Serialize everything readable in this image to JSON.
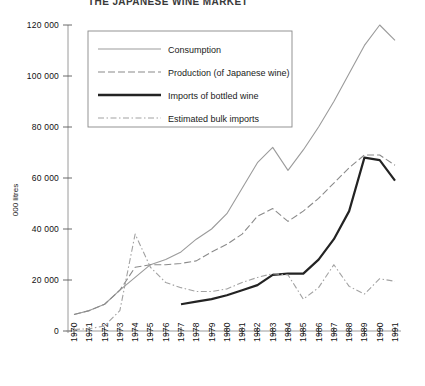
{
  "title_partial": "THE JAPANESE WINE MARKET",
  "axis": {
    "ylabel": "000 litres",
    "yticks": [
      "0",
      "20 000",
      "40 000",
      "60 000",
      "80 000",
      "100 000",
      "120 000"
    ],
    "xticks": [
      "1970",
      "1971",
      "1972",
      "1973",
      "1974",
      "1975",
      "1976",
      "1977",
      "1978",
      "1979",
      "1980",
      "1981",
      "1982",
      "1983",
      "1984",
      "1985",
      "1986",
      "1987",
      "1988",
      "1989",
      "1990",
      "1991"
    ]
  },
  "legend": {
    "items": [
      {
        "label": "Consumption",
        "style": "solid-thin",
        "color": "#9b9b9b"
      },
      {
        "label": "Production (of Japanese wine)",
        "style": "dashed",
        "color": "#8a8a8a"
      },
      {
        "label": "Imports of bottled wine",
        "style": "solid-thick",
        "color": "#232323"
      },
      {
        "label": "Estimated bulk imports",
        "style": "dash-dot",
        "color": "#a2a2a2"
      }
    ]
  },
  "chart_data": {
    "type": "line",
    "title": "THE JAPANESE WINE MARKET",
    "xlabel": "",
    "ylabel": "000 litres",
    "ylim": [
      0,
      120000
    ],
    "ytick_step": 20000,
    "grid": false,
    "legend_position": "upper-left-inside",
    "x": [
      1970,
      1971,
      1972,
      1973,
      1974,
      1975,
      1976,
      1977,
      1978,
      1979,
      1980,
      1981,
      1982,
      1983,
      1984,
      1985,
      1986,
      1987,
      1988,
      1989,
      1990,
      1991
    ],
    "series": [
      {
        "name": "Consumption",
        "color": "#9b9b9b",
        "style": "solid-thin",
        "values": [
          6500,
          8000,
          10500,
          16000,
          21000,
          26000,
          28000,
          31000,
          36000,
          40000,
          46000,
          56000,
          66000,
          72000,
          63000,
          71000,
          80000,
          90000,
          101000,
          112000,
          120000,
          114000
        ]
      },
      {
        "name": "Production (of Japanese wine)",
        "color": "#8a8a8a",
        "style": "dashed",
        "values": [
          6500,
          8000,
          10500,
          16000,
          25000,
          26000,
          26000,
          26500,
          27500,
          31000,
          34000,
          38000,
          45000,
          48000,
          43000,
          47000,
          52000,
          58000,
          64000,
          69000,
          69000,
          65000
        ]
      },
      {
        "name": "Imports of bottled wine",
        "color": "#232323",
        "style": "solid-thick",
        "values": [
          null,
          null,
          null,
          null,
          null,
          null,
          null,
          10500,
          11500,
          12500,
          14000,
          16000,
          18000,
          22000,
          22500,
          22500,
          28000,
          36000,
          47000,
          68000,
          67000,
          59000
        ]
      },
      {
        "name": "Estimated bulk imports",
        "color": "#a2a2a2",
        "style": "dash-dot",
        "values": [
          600,
          900,
          2000,
          8000,
          38000,
          25000,
          19000,
          17000,
          15500,
          15500,
          16500,
          19000,
          21000,
          22500,
          22000,
          12500,
          17000,
          26000,
          17500,
          14500,
          20500,
          19500
        ]
      }
    ]
  }
}
